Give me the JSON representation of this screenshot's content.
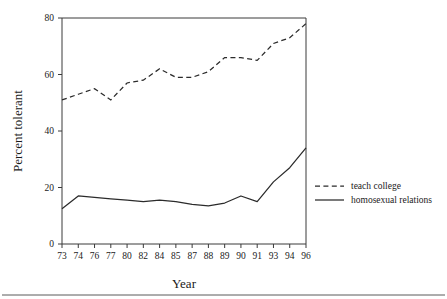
{
  "chart_data": {
    "type": "line",
    "title": "",
    "xlabel": "Year",
    "ylabel": "Percent tolerant",
    "categories": [
      "73",
      "74",
      "76",
      "77",
      "80",
      "82",
      "84",
      "85",
      "87",
      "88",
      "89",
      "90",
      "91",
      "93",
      "94",
      "96"
    ],
    "xtick_labels": [
      "73",
      "74",
      "76",
      "77",
      "80",
      "82",
      "84",
      "85",
      "87",
      "88",
      "89",
      "90",
      "91",
      "93",
      "94",
      "96"
    ],
    "ytick_labels": [
      "0",
      "20",
      "40",
      "60",
      "80"
    ],
    "ytick_values": [
      0,
      20,
      40,
      60,
      80
    ],
    "ylim": [
      0,
      80
    ],
    "grid": false,
    "legend_position": "right",
    "series": [
      {
        "name": "teach college",
        "style": "dashed",
        "color": "#2b2b2b",
        "values": [
          51,
          53,
          55,
          51,
          57,
          58,
          62,
          59,
          59,
          61,
          66,
          66,
          65,
          71,
          73,
          78
        ]
      },
      {
        "name": "homosexual relations",
        "style": "solid",
        "color": "#2b2b2b",
        "values": [
          12.5,
          17,
          16.5,
          16,
          15.5,
          15,
          15.5,
          15,
          14,
          13.5,
          14.5,
          17,
          15,
          22,
          27,
          34
        ]
      }
    ]
  },
  "legend": {
    "items": [
      {
        "label": "teach college",
        "style": "dashed"
      },
      {
        "label": "homosexual relations",
        "style": "solid"
      }
    ]
  },
  "axes": {
    "x_title": "Year",
    "y_title": "Percent tolerant"
  }
}
